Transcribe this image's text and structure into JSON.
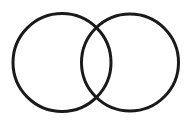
{
  "diagram": {
    "type": "venn",
    "background": "#ffffff",
    "stroke_color": "#1a1a1a",
    "stroke_width": 3,
    "circles": [
      {
        "name": "left-circle",
        "cx": 62,
        "cy": 62.5,
        "r": 49
      },
      {
        "name": "right-circle",
        "cx": 130,
        "cy": 62.5,
        "r": 48.5
      }
    ]
  }
}
